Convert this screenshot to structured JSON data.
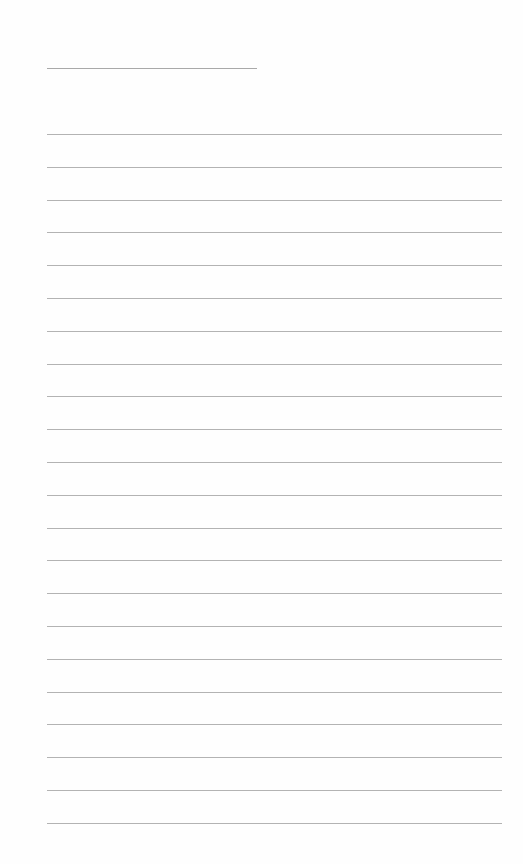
{
  "page": {
    "type": "blank lined paper",
    "title_line": {
      "x": 47,
      "y": 68,
      "width": 210
    },
    "rules": {
      "count": 22,
      "x": 47,
      "width": 455,
      "first_y": 134,
      "spacing": 32.8
    },
    "colors": {
      "background": "#fefefe",
      "rule": "#b3b3b3",
      "title_line": "#a9a9a9"
    }
  }
}
